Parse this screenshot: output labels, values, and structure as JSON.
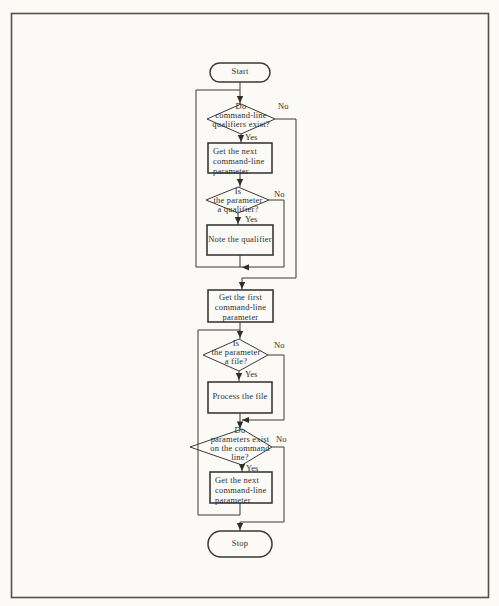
{
  "page": {
    "background_color": "#fbfaf7",
    "ink_color": "#3b3a35"
  },
  "flowchart": {
    "start": {
      "label": "Start"
    },
    "decision1": {
      "line1": "Do",
      "line2": "command-line",
      "line3": "qualifiers exist?"
    },
    "box1": {
      "line1": "Get the next",
      "line2": "command-line",
      "line3": "parameter"
    },
    "decision2": {
      "line1": "Is",
      "line2": "the parameter",
      "line3": "a qualifier?"
    },
    "box2": {
      "line1": "Note the qualifier"
    },
    "box3": {
      "line1": "Get the first",
      "line2": "command-line",
      "line3": "parameter"
    },
    "decision3": {
      "line1": "Is",
      "line2": "the parameter",
      "line3": "a file?"
    },
    "box4": {
      "line1": "Process the file"
    },
    "decision4": {
      "line1": "Do",
      "line2": "parameters exist",
      "line3": "on the command",
      "line4": "line?"
    },
    "box5": {
      "line1": "Get the next",
      "line2": "command-line",
      "line3": "parameter"
    },
    "stop": {
      "label": "Stop"
    },
    "branch_labels": {
      "yes": "Yes",
      "no": "No"
    }
  }
}
